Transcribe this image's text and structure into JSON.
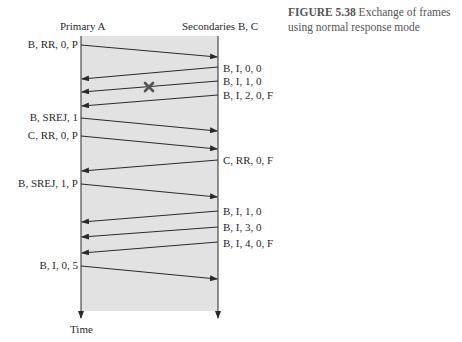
{
  "figure": {
    "number_label": "FIGURE 5.38",
    "caption_text": "Exchange of frames using normal response mode"
  },
  "headers": {
    "primary": "Primary A",
    "secondaries": "Secondaries B, C"
  },
  "time_label": "Time",
  "colors": {
    "background_band": "#e2e2e2",
    "line": "#2a2a2a",
    "lost_mark": "#555555"
  },
  "frames": [
    {
      "label": "B, RR, 0, P",
      "direction": "A->B"
    },
    {
      "label": "B, I, 0, 0",
      "direction": "B->A"
    },
    {
      "label": "B, I, 1, 0",
      "direction": "B->A",
      "lost": true
    },
    {
      "label": "B, I, 2, 0, F",
      "direction": "B->A"
    },
    {
      "label": "B, SREJ, 1",
      "direction": "A->B"
    },
    {
      "label": "C, RR, 0, P",
      "direction": "A->B"
    },
    {
      "label": "C, RR, 0, F",
      "direction": "B->A"
    },
    {
      "label": "B, SREJ, 1, P",
      "direction": "A->B"
    },
    {
      "label": "B, I, 1, 0",
      "direction": "B->A"
    },
    {
      "label": "B, I, 3, 0",
      "direction": "B->A"
    },
    {
      "label": "B, I, 4, 0, F",
      "direction": "B->A"
    },
    {
      "label": "B, I, 0, 5",
      "direction": "A->B"
    }
  ]
}
